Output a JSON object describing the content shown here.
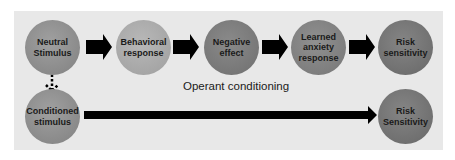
{
  "diagram": {
    "colors": {
      "panel_background": "#e8e8e8",
      "neutral_node": "#8e8e8e",
      "light_node": "#a8a8a8",
      "dark_node": "#7a7a7a",
      "arrow": "#000000"
    },
    "top_row": [
      {
        "id": "neutral-stimulus",
        "label": "Neutral Stimulus"
      },
      {
        "id": "behavioral-response",
        "label": "Behavioral response"
      },
      {
        "id": "negative-effect",
        "label": "Negative effect"
      },
      {
        "id": "learned-anxiety-response",
        "label": "Learned anxiety response"
      },
      {
        "id": "risk-sensitivity-top",
        "label": "Risk sensitivity"
      }
    ],
    "bottom_row": [
      {
        "id": "conditioned-stimulus",
        "label": "Conditioned stimulus"
      },
      {
        "id": "risk-sensitivity-bottom",
        "label": "Risk Sensitivity"
      }
    ],
    "annotation": "Operant conditioning",
    "edges": [
      {
        "from": "neutral-stimulus",
        "to": "behavioral-response",
        "style": "solid"
      },
      {
        "from": "behavioral-response",
        "to": "negative-effect",
        "style": "solid"
      },
      {
        "from": "negative-effect",
        "to": "learned-anxiety-response",
        "style": "solid"
      },
      {
        "from": "learned-anxiety-response",
        "to": "risk-sensitivity-top",
        "style": "solid"
      },
      {
        "from": "neutral-stimulus",
        "to": "conditioned-stimulus",
        "style": "dotted"
      },
      {
        "from": "conditioned-stimulus",
        "to": "risk-sensitivity-bottom",
        "style": "solid"
      }
    ]
  }
}
